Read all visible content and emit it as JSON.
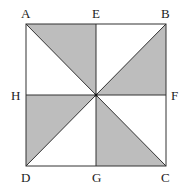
{
  "diagram": {
    "type": "geometry-square-pinwheel",
    "square": {
      "x1": 26,
      "y1": 24,
      "x2": 166,
      "y2": 166
    },
    "center": {
      "x": 96,
      "y": 95
    },
    "colors": {
      "shade": "#bdbdbd",
      "stroke": "#333333"
    },
    "labels": {
      "A": "A",
      "E": "E",
      "B": "B",
      "H": "H",
      "F": "F",
      "D": "D",
      "G": "G",
      "C": "C"
    },
    "shaded_triangles": [
      "A-E-O",
      "B-F-O",
      "H-D-O",
      "G-C-O"
    ]
  }
}
